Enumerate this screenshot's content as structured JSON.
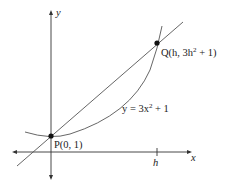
{
  "diagram": {
    "axes": {
      "x_label": "x",
      "y_label": "y"
    },
    "curve_label": {
      "prefix": "y = 3x",
      "exp": "2",
      "suffix": " + 1"
    },
    "point_p": {
      "label": "P(0, 1)"
    },
    "point_q": {
      "prefix": "Q(h, 3h",
      "exp": "2",
      "suffix": " + 1)"
    },
    "tick_h": "h",
    "colors": {
      "axis": "#333333",
      "curve": "#555555",
      "point": "#111111"
    }
  }
}
